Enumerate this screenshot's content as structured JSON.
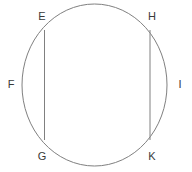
{
  "figure": {
    "background_color": "#ffffff",
    "stroke_color": "#808080",
    "text_color": "#3a3a3a",
    "stroke_width": 1,
    "width": 192,
    "height": 172
  },
  "shapes": {
    "circle": {
      "name": "circle",
      "cx": 94.5,
      "cy": 85,
      "rx": 72.5,
      "ry": 81
    },
    "chords": [
      {
        "name": "chord-EG",
        "from": "E",
        "to": "G",
        "x1": 44.5,
        "y1": 30,
        "x2": 44.5,
        "y2": 140
      },
      {
        "name": "chord-HK",
        "from": "H",
        "to": "K",
        "x1": 150,
        "y1": 30,
        "x2": 150,
        "y2": 140
      }
    ]
  },
  "labels": [
    {
      "id": "E",
      "text": "E",
      "x": 42,
      "y": 16
    },
    {
      "id": "H",
      "text": "H",
      "x": 152,
      "y": 16
    },
    {
      "id": "F",
      "text": "F",
      "x": 11,
      "y": 84
    },
    {
      "id": "I",
      "text": "I",
      "x": 180,
      "y": 84
    },
    {
      "id": "G",
      "text": "G",
      "x": 42,
      "y": 156
    },
    {
      "id": "K",
      "text": "K",
      "x": 152,
      "y": 156
    }
  ]
}
